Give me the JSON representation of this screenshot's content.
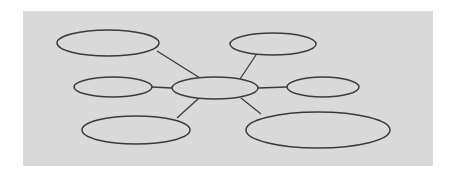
{
  "diagram": {
    "type": "hub-and-spoke",
    "background_color": "#ffffff",
    "panel": {
      "x": 23,
      "y": 11,
      "width": 410,
      "height": 155,
      "fill": "#d9d9d9"
    },
    "stroke_color": "#3a3a3a",
    "node_fill": "#d9d9d9",
    "hub": {
      "id": "center",
      "label": "",
      "cx": 215,
      "cy": 88,
      "rx": 43,
      "ry": 11
    },
    "nodes": [
      {
        "id": "top-left",
        "label": "",
        "cx": 108,
        "cy": 43,
        "rx": 51,
        "ry": 13
      },
      {
        "id": "top-right",
        "label": "",
        "cx": 273,
        "cy": 44,
        "rx": 43,
        "ry": 11
      },
      {
        "id": "middle-left",
        "label": "",
        "cx": 113,
        "cy": 87,
        "rx": 39,
        "ry": 10
      },
      {
        "id": "middle-right",
        "label": "",
        "cx": 323,
        "cy": 87,
        "rx": 36,
        "ry": 10
      },
      {
        "id": "bottom-left",
        "label": "",
        "cx": 136,
        "cy": 130,
        "rx": 54,
        "ry": 14
      },
      {
        "id": "bottom-right",
        "label": "",
        "cx": 318,
        "cy": 130,
        "rx": 72,
        "ry": 18
      }
    ],
    "edges": [
      {
        "from": "top-left",
        "to": "center",
        "x1": 157,
        "y1": 51,
        "x2": 200,
        "y2": 78
      },
      {
        "from": "top-right",
        "to": "center",
        "x1": 256,
        "y1": 55,
        "x2": 240,
        "y2": 79
      },
      {
        "from": "middle-left",
        "to": "center",
        "x1": 152,
        "y1": 87,
        "x2": 172,
        "y2": 88
      },
      {
        "from": "center",
        "to": "middle-right",
        "x1": 258,
        "y1": 88,
        "x2": 287,
        "y2": 87
      },
      {
        "from": "center",
        "to": "bottom-left",
        "x1": 199,
        "y1": 98,
        "x2": 177,
        "y2": 118
      },
      {
        "from": "center",
        "to": "bottom-right",
        "x1": 241,
        "y1": 98,
        "x2": 261,
        "y2": 114
      }
    ]
  }
}
